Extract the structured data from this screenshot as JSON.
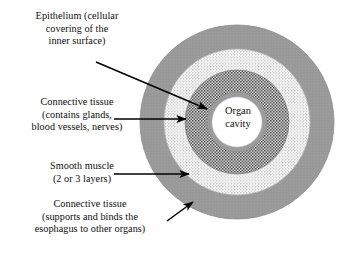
{
  "figure": {
    "type": "concentric-ring-diagram"
  },
  "center_label": {
    "name": "organ-cavity",
    "lines": [
      "Organ",
      "cavity"
    ]
  },
  "callouts": [
    {
      "id": "epithelium",
      "name": "epithelium",
      "lines": [
        "Epithelium (cellular",
        "covering of the",
        "inner surface)"
      ],
      "arrow": "diagonal-down-right",
      "points_to": "epithelium-ring"
    },
    {
      "id": "connective-inner",
      "name": "connective-tissue-inner",
      "lines": [
        "Connective tissue",
        "(contains glands,",
        "blood vessels, nerves)"
      ],
      "arrow": "horizontal-right",
      "points_to": "connective-inner-ring"
    },
    {
      "id": "smooth-muscle",
      "name": "smooth-muscle",
      "lines": [
        "Smooth muscle",
        "(2 or 3 layers)"
      ],
      "arrow": "horizontal-right",
      "points_to": "smooth-muscle-ring"
    },
    {
      "id": "connective-outer",
      "name": "connective-tissue-outer",
      "lines": [
        "Connective tissue",
        "(supports and binds the",
        "esophagus to other organs)"
      ],
      "arrow": "diagonal-up-right",
      "points_to": "connective-outer-ring"
    }
  ],
  "rings": [
    {
      "id": "connective-outer-ring",
      "name": "connective-tissue-outer-ring",
      "label": "Connective tissue (supports and binds the esophagus to other organs)",
      "outer_radius": 97,
      "inner_radius": 73,
      "fill": "#9a9a9a",
      "pattern": "solid"
    },
    {
      "id": "smooth-muscle-ring",
      "name": "smooth-muscle-ring",
      "label": "Smooth muscle (2 or 3 layers)",
      "outer_radius": 73,
      "inner_radius": 52,
      "fill": "#f2f2f2",
      "pattern": "fine-light-stipple"
    },
    {
      "id": "connective-inner-ring",
      "name": "connective-tissue-inner-ring",
      "label": "Connective tissue (contains glands, blood vessels, nerves)",
      "outer_radius": 52,
      "inner_radius": 30,
      "fill": "#d8d8d8",
      "pattern": "dense-dark-stipple"
    },
    {
      "id": "epithelium-ring",
      "name": "epithelium-ring",
      "label": "Epithelium (cellular covering of the inner surface)",
      "outer_radius": 30,
      "inner_radius": 25,
      "fill": "#9c9c9c",
      "pattern": "solid"
    },
    {
      "id": "organ-cavity",
      "name": "organ-cavity",
      "label": "Organ cavity",
      "outer_radius": 25,
      "inner_radius": 0,
      "fill": "#ffffff",
      "pattern": "solid"
    }
  ],
  "geometry": {
    "center_x": 237,
    "center_y": 122
  },
  "colors": {
    "outer_ring": "#9a9a9a",
    "muscle_ring": "#f2f2f2",
    "inner_connective_ring": "#d8d8d8",
    "epithelium_ring": "#9c9c9c",
    "cavity": "#ffffff",
    "stipple_dark": "#4c4c4c",
    "stipple_light": "#9f9f9f",
    "arrow": "#000000",
    "text": "#0d0d0d",
    "background": "#ffffff"
  }
}
